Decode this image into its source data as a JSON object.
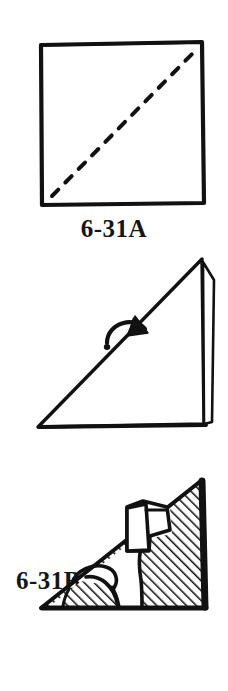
{
  "page": {
    "background_color": "#ffffff",
    "ink_color": "#111111",
    "width": 228,
    "height": 691
  },
  "figures": [
    {
      "id": "6-31A",
      "caption": "6-31A",
      "caption_position": "below-center",
      "shape": "square",
      "description": "Hand-drawn square sheet of paper with a dashed diagonal fold line running from the bottom-left corner to the top-right corner.",
      "elements": [
        {
          "name": "square-outline",
          "kind": "square",
          "stroke": "#111111"
        },
        {
          "name": "diagonal-fold-line",
          "kind": "dashed-line",
          "direction": "bottom-left-to-top-right",
          "stroke": "#111111"
        }
      ]
    },
    {
      "id": "6-31B",
      "caption": "6-31B",
      "caption_position": "left",
      "shape": "right-triangle",
      "description": "The square folded in half along the diagonal, forming a right triangle with a thin folded flap visible along the right edge. A curved arrow points down toward the folded edge.",
      "elements": [
        {
          "name": "triangle-outline",
          "kind": "triangle",
          "stroke": "#111111"
        },
        {
          "name": "folded-flap-sliver",
          "kind": "sliver",
          "stroke": "#111111"
        },
        {
          "name": "curved-arrow",
          "kind": "arrow",
          "direction": "down-right",
          "stroke": "#111111"
        }
      ]
    },
    {
      "id": "6-31C",
      "caption": "6-31C",
      "caption_position": "left",
      "shape": "hatched-right-triangle",
      "description": "The folded triangle with a dog silhouette drawn on it; the area around the dog is filled with diagonal hatching, the dog shape remains white.",
      "elements": [
        {
          "name": "triangle-outline",
          "kind": "triangle",
          "stroke": "#111111"
        },
        {
          "name": "diagonal-hatching",
          "kind": "hatch-fill",
          "angle_degrees": 45,
          "spacing_px": 7,
          "stroke": "#111111"
        },
        {
          "name": "dog-silhouette",
          "kind": "white-figure",
          "stroke": "#111111"
        },
        {
          "name": "dog-ear-flap",
          "kind": "white-figure",
          "stroke": "#111111"
        },
        {
          "name": "dog-tail",
          "kind": "white-figure",
          "stroke": "#111111"
        }
      ]
    }
  ]
}
